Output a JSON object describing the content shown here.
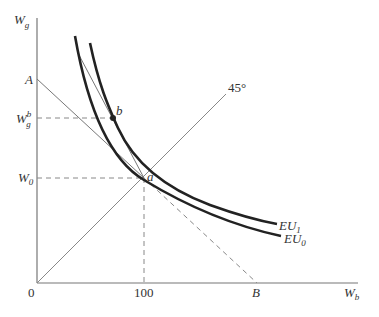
{
  "diagram": {
    "type": "economics-expected-utility",
    "axes": {
      "y_label": "W",
      "y_label_sub": "g",
      "x_label": "W",
      "x_label_sub": "b",
      "origin_label": "0"
    },
    "labels": {
      "A": "A",
      "B": "B",
      "a": "a",
      "b": "b",
      "forty_five": "45°",
      "x_tick_100": "100",
      "W0": "W",
      "W0_sub": "0",
      "Wgb": "W",
      "Wgb_sub": "g",
      "Wgb_sup": "b",
      "EU1": "EU",
      "EU1_sub": "1",
      "EU0": "EU",
      "EU0_sub": "0"
    },
    "colors": {
      "axis": "#777777",
      "curve": "#222222",
      "thin_line": "#777777",
      "dashed": "#777777"
    }
  }
}
